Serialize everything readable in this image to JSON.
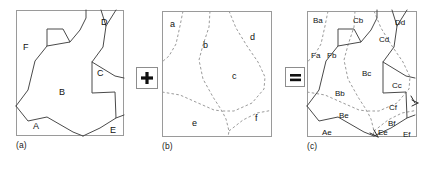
{
  "figure": {
    "background_color": "#ffffff",
    "solid_line_color": "#4a4a4a",
    "dashed_line_color": "#9b9b9b",
    "frame_color": "#9a9a9a"
  },
  "panels": [
    {
      "id": "a",
      "caption": "(a)",
      "line_style": "solid",
      "frame": {
        "x": 16,
        "y": 10,
        "w": 108,
        "h": 126
      },
      "labels": [
        {
          "text": "D",
          "x": 101,
          "y": 18
        },
        {
          "text": "F",
          "x": 23,
          "y": 43
        },
        {
          "text": "C",
          "x": 97,
          "y": 69
        },
        {
          "text": "B",
          "x": 59,
          "y": 88
        },
        {
          "text": "A",
          "x": 33,
          "y": 122
        },
        {
          "text": "E",
          "x": 110,
          "y": 126
        }
      ]
    },
    {
      "id": "b",
      "caption": "(b)",
      "line_style": "dashed",
      "frame": {
        "x": 162,
        "y": 11,
        "w": 110,
        "h": 126
      },
      "labels": [
        {
          "text": "a",
          "x": 170,
          "y": 20
        },
        {
          "text": "b",
          "x": 203,
          "y": 41
        },
        {
          "text": "d",
          "x": 250,
          "y": 33
        },
        {
          "text": "c",
          "x": 232,
          "y": 72
        },
        {
          "text": "e",
          "x": 192,
          "y": 119
        },
        {
          "text": "f",
          "x": 255,
          "y": 114
        }
      ]
    },
    {
      "id": "c",
      "caption": "(c)",
      "line_style": "both",
      "frame": {
        "x": 307,
        "y": 11,
        "w": 110,
        "h": 126
      },
      "labels": [
        {
          "text": "Ba",
          "x": 313,
          "y": 17
        },
        {
          "text": "Cb",
          "x": 353,
          "y": 17
        },
        {
          "text": "Dd",
          "x": 395,
          "y": 19
        },
        {
          "text": "Cd",
          "x": 379,
          "y": 36
        },
        {
          "text": "Fa",
          "x": 311,
          "y": 52
        },
        {
          "text": "Fb",
          "x": 327,
          "y": 52
        },
        {
          "text": "Bc",
          "x": 362,
          "y": 70
        },
        {
          "text": "Cc",
          "x": 392,
          "y": 82
        },
        {
          "text": "Bb",
          "x": 335,
          "y": 90
        },
        {
          "text": "Cf",
          "x": 389,
          "y": 104
        },
        {
          "text": "Be",
          "x": 339,
          "y": 112
        },
        {
          "text": "Bf",
          "x": 388,
          "y": 120
        },
        {
          "text": "Ae",
          "x": 322,
          "y": 129
        },
        {
          "text": "Ee",
          "x": 378,
          "y": 129
        },
        {
          "text": "Ef",
          "x": 403,
          "y": 131
        }
      ]
    }
  ],
  "operators": [
    {
      "id": "plus",
      "symbol": "+",
      "name": "plus-operator",
      "x": 136,
      "y": 67,
      "size": 22
    },
    {
      "id": "equals",
      "symbol": "=",
      "name": "equals-operator",
      "x": 285,
      "y": 67,
      "size": 20
    }
  ],
  "geometry": {
    "panel_a_solid": [
      "M 16 106 L 28 90 L 35 61 L 47 46 L 47 29 L 63 29 L 70 42 L 47 46",
      "M 16 106 L 28 121 L 47 117 L 73 132 L 83 136",
      "M 83 136 L 100 128 L 116 118 L 115 92 L 92 93 L 92 62 L 103 47 L 106 26 L 101 10",
      "M 70 42 L 80 30 L 86 18 L 86 10",
      "M 92 62 L 115 76 L 124 78",
      "M 116 118 L 124 115",
      "M 106 26 L 116 10"
    ],
    "panel_b_dashed": [
      "M 183 11 L 180 26 L 176 44 L 169 56 L 162 62",
      "M 210 11 L 209 27 L 203 45 L 199 60 L 203 79 L 213 97 L 222 111 L 226 119 L 229 131 L 228 137",
      "M 229 11 L 236 28 L 247 46 L 258 62 L 265 77 L 264 89 L 252 103 L 234 111 L 222 111",
      "M 162 92 L 180 95 L 198 103 L 214 110 L 222 111",
      "M 229 131 L 243 120 L 257 113 L 268 111 L 272 110"
    ],
    "panel_c_solid": [
      "M 307 106 L 319 90 L 326 61 L 338 46 L 338 29 L 354 29 L 361 42 L 338 46",
      "M 307 106 L 319 121 L 338 117 L 364 132 L 374 136",
      "M 374 136 L 391 128 L 407 118 L 406 92 L 383 93 L 383 62 L 394 47 L 397 26 L 392 10",
      "M 361 42 L 371 30 L 377 18 L 377 10",
      "M 383 62 L 406 76 L 415 78",
      "M 407 118 L 415 115",
      "M 397 26 L 407 10"
    ],
    "panel_c_dashed": [
      "M 328 11 L 325 26 L 321 44 L 314 56 L 307 62",
      "M 355 11 L 354 27 L 348 45 L 344 60 L 348 79 L 358 97 L 367 111 L 371 119 L 374 131 L 373 137",
      "M 374 11 L 381 28 L 392 46 L 403 62 L 410 77 L 409 89 L 397 103 L 379 111 L 367 111",
      "M 307 92 L 325 95 L 343 103 L 359 110 L 367 111",
      "M 374 131 L 388 120 L 402 113 L 413 111 L 417 110"
    ]
  }
}
